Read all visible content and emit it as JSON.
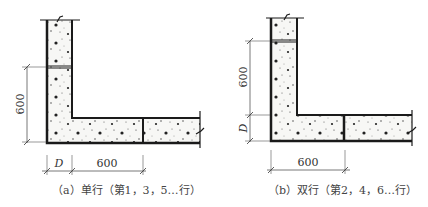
{
  "figure": {
    "panels": [
      {
        "id": "a",
        "caption": "（a）单行（第1，3，5…行）",
        "dims": {
          "vertical": "600",
          "depth": "D",
          "horizontal": "600"
        }
      },
      {
        "id": "b",
        "caption": "（b）双行（第2，4，6…行）",
        "dims": {
          "vertical": "600",
          "depth": "D",
          "horizontal": "600"
        }
      }
    ],
    "colors": {
      "line": "#1a1a1a",
      "fill": "#f4f4f2",
      "text": "#444444"
    }
  }
}
